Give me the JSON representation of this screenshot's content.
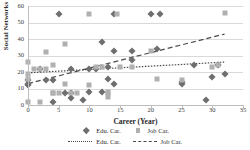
{
  "chart_data": {
    "type": "scatter",
    "title": "",
    "xlabel": "Career (Year)",
    "ylabel": "Social Networks",
    "xlim": [
      0,
      35
    ],
    "ylim": [
      0,
      60
    ],
    "xticks": [
      0,
      5,
      10,
      15,
      20,
      25,
      30,
      35
    ],
    "yticks": [
      0,
      10,
      20,
      30,
      40,
      50,
      60
    ],
    "grid": "horizontal",
    "legend_position": "bottom",
    "legend": [
      {
        "label": "Edu. Car.",
        "marker": "diamond",
        "color": "#6e6e6e"
      },
      {
        "label": "Job Car.",
        "marker": "square",
        "color": "#b0b0b0"
      },
      {
        "label": "Edu. Car.",
        "marker": "dotted-line",
        "color": "#4a4a4a"
      },
      {
        "label": "Job Car.",
        "marker": "dashed-line",
        "color": "#4a4a4a"
      }
    ],
    "series": [
      {
        "name": "Edu. Car.",
        "marker": "diamond",
        "color": "#6e6e6e",
        "points": [
          [
            0,
            15
          ],
          [
            0,
            13
          ],
          [
            0,
            12
          ],
          [
            2,
            22
          ],
          [
            3,
            15
          ],
          [
            4,
            15
          ],
          [
            4,
            2
          ],
          [
            5,
            55
          ],
          [
            6,
            7
          ],
          [
            7,
            22
          ],
          [
            7,
            4
          ],
          [
            7,
            7
          ],
          [
            9,
            3
          ],
          [
            10,
            8
          ],
          [
            10,
            22
          ],
          [
            11,
            22
          ],
          [
            12,
            38
          ],
          [
            12,
            8
          ],
          [
            13,
            23
          ],
          [
            13,
            16
          ],
          [
            14,
            33
          ],
          [
            14,
            55
          ],
          [
            14,
            13
          ],
          [
            17,
            33
          ],
          [
            17,
            27
          ],
          [
            20,
            55
          ],
          [
            21.5,
            55
          ],
          [
            21,
            34
          ],
          [
            25,
            14
          ],
          [
            25,
            13
          ],
          [
            27,
            24
          ],
          [
            29,
            3
          ],
          [
            30,
            17
          ],
          [
            31,
            24
          ],
          [
            32,
            19
          ]
        ]
      },
      {
        "name": "Job Car.",
        "marker": "square",
        "color": "#b0b0b0",
        "points": [
          [
            0,
            26
          ],
          [
            0,
            19
          ],
          [
            0,
            16
          ],
          [
            0,
            2
          ],
          [
            1,
            22
          ],
          [
            2,
            22
          ],
          [
            2,
            2
          ],
          [
            3,
            32
          ],
          [
            3,
            22
          ],
          [
            4,
            24
          ],
          [
            4,
            7
          ],
          [
            4,
            7
          ],
          [
            5,
            7
          ],
          [
            6,
            13
          ],
          [
            6,
            37
          ],
          [
            7,
            7
          ],
          [
            8,
            7
          ],
          [
            10,
            12
          ],
          [
            10,
            55
          ],
          [
            11,
            23
          ],
          [
            12,
            23
          ],
          [
            13,
            8
          ],
          [
            13,
            7
          ],
          [
            13,
            5
          ],
          [
            14.5,
            55
          ],
          [
            15,
            23
          ],
          [
            17,
            23
          ],
          [
            20,
            33
          ],
          [
            21,
            16
          ],
          [
            25,
            15
          ],
          [
            30,
            23
          ],
          [
            31,
            24
          ],
          [
            32,
            56
          ]
        ]
      }
    ],
    "trendlines": [
      {
        "name": "Edu. Car.",
        "style": "dotted",
        "color": "#4a4a4a",
        "x0": 0,
        "y0": 19.5,
        "x1": 32,
        "y1": 26
      },
      {
        "name": "Job Car.",
        "style": "dashed",
        "color": "#4a4a4a",
        "x0": 0,
        "y0": 13,
        "x1": 32,
        "y1": 43
      }
    ]
  }
}
